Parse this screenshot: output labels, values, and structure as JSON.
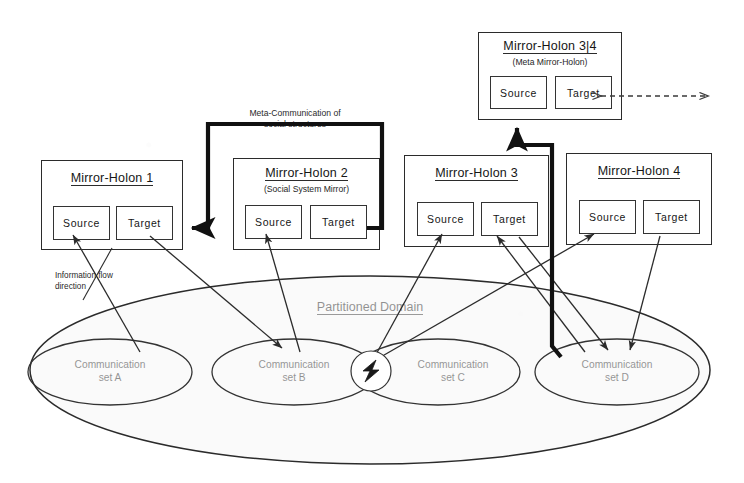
{
  "diagram": {
    "domain_label": "Partitioned Domain",
    "notes": {
      "meta_communication": "Meta-Communication of\nsocial structures",
      "information_flow": "Information flow\ndirection"
    },
    "slot_labels": {
      "source": "Source",
      "target": "Target"
    },
    "holons": [
      {
        "id": "mh1",
        "title": "Mirror-Holon 1",
        "subtitle": "",
        "source": "Source",
        "target": "Target"
      },
      {
        "id": "mh2",
        "title": "Mirror-Holon 2",
        "subtitle": "(Social System Mirror)",
        "source": "Source",
        "target": "Target"
      },
      {
        "id": "mh3",
        "title": "Mirror-Holon 3",
        "subtitle": "",
        "source": "Source",
        "target": "Target"
      },
      {
        "id": "mh4",
        "title": "Mirror-Holon 4",
        "subtitle": "",
        "source": "Source",
        "target": "Target"
      },
      {
        "id": "mh34",
        "title": "Mirror-Holon 3|4",
        "subtitle": "(Meta Mirror-Holon)",
        "source": "Source",
        "target": "Target"
      }
    ],
    "communication_sets": [
      {
        "id": "set-a",
        "line1": "Communication",
        "line2": "set A"
      },
      {
        "id": "set-b",
        "line1": "Communication",
        "line2": "set B"
      },
      {
        "id": "set-c",
        "line1": "Communication",
        "line2": "set C"
      },
      {
        "id": "set-d",
        "line1": "Communication",
        "line2": "set D"
      }
    ],
    "conflict_marker": {
      "id": "conflict-bolt",
      "symbol": "lightning-bolt",
      "location": "set B and set C intersection"
    },
    "colors": {
      "ink": "#2b2b2b",
      "thick_ink": "#111111",
      "paper": "#ffffff"
    },
    "icons": {
      "arrow": "arrow-head",
      "dashed_double_arrow": "dashed-bidirectional-arrow",
      "bolt": "lightning-bolt-icon"
    }
  }
}
